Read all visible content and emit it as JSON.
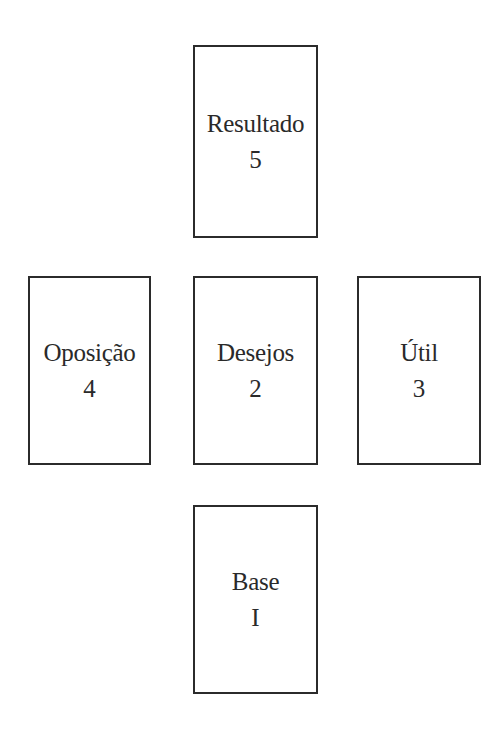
{
  "spread": {
    "cards": {
      "top": {
        "label": "Resultado",
        "number": "5"
      },
      "left": {
        "label": "Oposição",
        "number": "4"
      },
      "center": {
        "label": "Desejos",
        "number": "2"
      },
      "right": {
        "label": "Útil",
        "number": "3"
      },
      "bottom": {
        "label": "Base",
        "number": "I"
      }
    }
  },
  "colors": {
    "border": "#2b2b2b",
    "text": "#2a2a2a",
    "background": "#ffffff"
  }
}
